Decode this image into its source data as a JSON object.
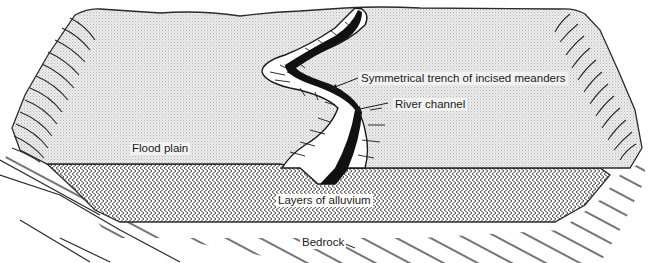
{
  "diagram": {
    "colors": {
      "flood_plain_fill": "#e8e8e8",
      "stipple": "#b8b8b8",
      "outline": "#2a2a2a",
      "channel_fill": "#111111",
      "background": "#ffffff"
    },
    "labels": {
      "trench": "Symmetrical trench of incised meanders",
      "river_channel": "River channel",
      "flood_plain": "Flood plain",
      "alluvium": "Layers of alluvium",
      "bedrock": "Bedrock"
    },
    "layers": [
      "Flood plain",
      "Layers of alluvium",
      "Bedrock"
    ]
  }
}
